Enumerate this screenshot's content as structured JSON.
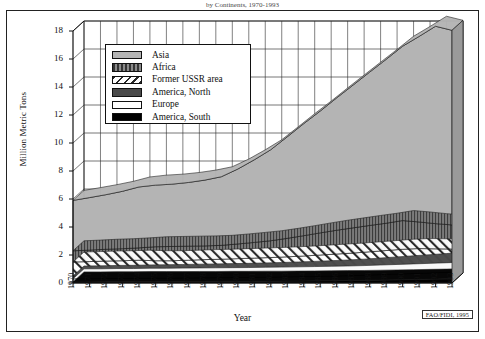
{
  "figure": {
    "title_partial": "by Continents, 1970-1993",
    "credit": "FAO/FIDI, 1995"
  },
  "axes": {
    "ylabel": "Million Metric Tons",
    "xlabel": "Year",
    "yticks": [
      "0",
      "2",
      "4",
      "6",
      "8",
      "10",
      "12",
      "14",
      "16",
      "18"
    ],
    "xticks": [
      "1970",
      "1971",
      "1972",
      "1973",
      "1974",
      "1975",
      "1976",
      "1977",
      "1978",
      "1979",
      "1980",
      "1981",
      "1982",
      "1983",
      "1984",
      "1985",
      "1986",
      "1987",
      "1988",
      "1989",
      "1990",
      "1991",
      "1992",
      "1993"
    ]
  },
  "legend": {
    "items": [
      {
        "label": "Asia",
        "swatch": "light-gray-solid",
        "color": "#b4b4b4"
      },
      {
        "label": "Africa",
        "swatch": "vertical-hatch-dark",
        "color": "#6e6e6e"
      },
      {
        "label": "Former USSR area",
        "swatch": "diagonal-hatch",
        "color": "#ffffff"
      },
      {
        "label": "America, North",
        "swatch": "dark-gray-solid",
        "color": "#4a4a4a"
      },
      {
        "label": "Europe",
        "swatch": "white-solid",
        "color": "#ffffff"
      },
      {
        "label": "America, South",
        "swatch": "black-solid",
        "color": "#000000"
      }
    ]
  },
  "chart_data": {
    "type": "area",
    "title": "by Continents, 1970-1993",
    "xlabel": "Year",
    "ylabel": "Million Metric Tons",
    "ylim": [
      0,
      18
    ],
    "grid": true,
    "legend_position": "upper-left-inside",
    "stacked": true,
    "stack_order_bottom_to_top": [
      "America, South",
      "Europe",
      "America, North",
      "Former USSR area",
      "Africa",
      "Asia"
    ],
    "categories": [
      "1970",
      "1971",
      "1972",
      "1973",
      "1974",
      "1975",
      "1976",
      "1977",
      "1978",
      "1979",
      "1980",
      "1981",
      "1982",
      "1983",
      "1984",
      "1985",
      "1986",
      "1987",
      "1988",
      "1989",
      "1990",
      "1991",
      "1992",
      "1993"
    ],
    "series": [
      {
        "name": "America, South",
        "color": "#000000",
        "values": [
          0.08,
          0.08,
          0.09,
          0.09,
          0.1,
          0.1,
          0.1,
          0.11,
          0.11,
          0.12,
          0.12,
          0.13,
          0.13,
          0.14,
          0.15,
          0.16,
          0.17,
          0.18,
          0.2,
          0.22,
          0.24,
          0.26,
          0.28,
          0.3
        ]
      },
      {
        "name": "Europe",
        "color": "#ffffff",
        "values": [
          0.22,
          0.22,
          0.23,
          0.23,
          0.24,
          0.24,
          0.25,
          0.25,
          0.26,
          0.26,
          0.27,
          0.28,
          0.29,
          0.3,
          0.31,
          0.32,
          0.33,
          0.35,
          0.37,
          0.39,
          0.41,
          0.43,
          0.45,
          0.48
        ]
      },
      {
        "name": "America, North",
        "color": "#4a4a4a",
        "values": [
          0.2,
          0.21,
          0.22,
          0.23,
          0.24,
          0.25,
          0.26,
          0.27,
          0.28,
          0.29,
          0.3,
          0.31,
          0.33,
          0.35,
          0.37,
          0.4,
          0.43,
          0.46,
          0.5,
          0.54,
          0.58,
          0.62,
          0.66,
          0.7
        ]
      },
      {
        "name": "Former USSR area",
        "color": "#ffffff",
        "values": [
          1.0,
          1.02,
          1.03,
          1.04,
          1.05,
          1.0,
          0.98,
          1.0,
          1.02,
          1.03,
          1.05,
          1.06,
          1.07,
          1.08,
          1.1,
          1.12,
          1.14,
          1.15,
          1.16,
          1.17,
          1.18,
          1.15,
          1.05,
          0.95
        ]
      },
      {
        "name": "Africa",
        "color": "#6e6e6e",
        "values": [
          0.8,
          0.82,
          0.84,
          0.86,
          0.88,
          1.0,
          1.02,
          1.0,
          0.98,
          0.99,
          1.05,
          1.12,
          1.2,
          1.32,
          1.45,
          1.58,
          1.7,
          1.8,
          1.88,
          1.95,
          2.05,
          1.9,
          1.8,
          1.72
        ]
      },
      {
        "name": "Asia",
        "color": "#b4b4b4",
        "values": [
          3.6,
          3.75,
          3.9,
          4.1,
          4.35,
          4.4,
          4.45,
          4.55,
          4.7,
          4.9,
          5.35,
          5.9,
          6.5,
          7.25,
          8.0,
          8.7,
          9.45,
          10.2,
          10.95,
          11.7,
          12.45,
          13.25,
          14.1,
          13.9
        ]
      }
    ],
    "totals": [
      5.9,
      6.1,
      6.31,
      6.55,
      6.86,
      6.99,
      7.06,
      7.18,
      7.35,
      7.59,
      8.14,
      8.8,
      9.52,
      10.44,
      11.38,
      12.28,
      13.22,
      14.14,
      15.06,
      15.97,
      16.91,
      17.61,
      18.34,
      18.05
    ],
    "cumulative_tops": {
      "america_south": [
        0.08,
        0.08,
        0.09,
        0.09,
        0.1,
        0.1,
        0.1,
        0.11,
        0.11,
        0.12,
        0.12,
        0.13,
        0.13,
        0.14,
        0.15,
        0.16,
        0.17,
        0.18,
        0.2,
        0.22,
        0.24,
        0.26,
        0.28,
        0.3
      ],
      "europe": [
        0.3,
        0.3,
        0.32,
        0.32,
        0.34,
        0.34,
        0.35,
        0.36,
        0.37,
        0.38,
        0.39,
        0.41,
        0.42,
        0.44,
        0.46,
        0.48,
        0.5,
        0.53,
        0.57,
        0.61,
        0.65,
        0.69,
        0.73,
        0.78
      ],
      "america_north": [
        0.5,
        0.51,
        0.54,
        0.55,
        0.58,
        0.59,
        0.61,
        0.63,
        0.65,
        0.67,
        0.69,
        0.72,
        0.75,
        0.79,
        0.83,
        0.88,
        0.93,
        0.99,
        1.07,
        1.15,
        1.23,
        1.31,
        1.39,
        1.48
      ],
      "former_ussr": [
        1.5,
        1.53,
        1.57,
        1.59,
        1.63,
        1.59,
        1.59,
        1.63,
        1.67,
        1.7,
        1.74,
        1.78,
        1.82,
        1.87,
        1.93,
        2.0,
        2.07,
        2.14,
        2.23,
        2.32,
        2.41,
        2.46,
        2.44,
        2.43
      ],
      "africa": [
        2.3,
        2.35,
        2.41,
        2.45,
        2.51,
        2.59,
        2.61,
        2.63,
        2.65,
        2.69,
        2.79,
        2.9,
        3.02,
        3.19,
        3.38,
        3.58,
        3.77,
        3.94,
        4.11,
        4.27,
        4.46,
        4.36,
        4.24,
        4.15
      ],
      "asia": [
        5.9,
        6.1,
        6.31,
        6.55,
        6.86,
        6.99,
        7.06,
        7.18,
        7.35,
        7.59,
        8.14,
        8.8,
        9.52,
        10.44,
        11.38,
        12.28,
        13.22,
        14.14,
        15.06,
        15.97,
        16.91,
        17.61,
        18.34,
        18.05
      ]
    }
  }
}
